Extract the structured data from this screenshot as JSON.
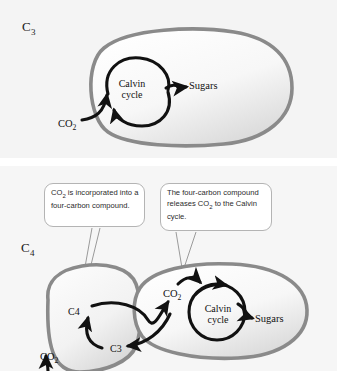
{
  "figure": {
    "panels": [
      {
        "id": "c3",
        "label": "C",
        "label_sub": "3",
        "cell_type": "mesophyll-cell",
        "texts": {
          "co2_in": "CO",
          "co2_in_sub": "2",
          "calvin_cycle": "Calvin cycle",
          "sugars": "Sugars"
        }
      },
      {
        "id": "c4",
        "label": "C",
        "label_sub": "4",
        "texts": {
          "co2_in": "CO",
          "co2_in_sub": "2",
          "c4_compound": "C4",
          "c3_compound": "C3",
          "co2_released": "CO",
          "co2_released_sub": "2",
          "calvin_cycle": "Calvin cycle",
          "sugars": "Sugars"
        },
        "callouts": [
          {
            "id": "callout-left",
            "line1": "CO",
            "line1_sub": "2",
            "line1_rest": " is incorporated",
            "line2": "into a four-carbon",
            "line3": "compound."
          },
          {
            "id": "callout-right",
            "line1": "The four-carbon",
            "line2": "compound releases",
            "line3_pre": "CO",
            "line3_sub": "2",
            "line3_rest": " to the Calvin cycle."
          }
        ]
      }
    ],
    "colors": {
      "membrane": "#8a8a8a",
      "cell_fill_light": "#fdfdfd",
      "cell_fill_shadow": "#dcdcdc",
      "arrow": "#111111",
      "callout_border": "#b4b4b4",
      "panel_background": "#f4f4f4",
      "page_background": "#ffffff",
      "leader_line": "#9a9a9a"
    }
  }
}
